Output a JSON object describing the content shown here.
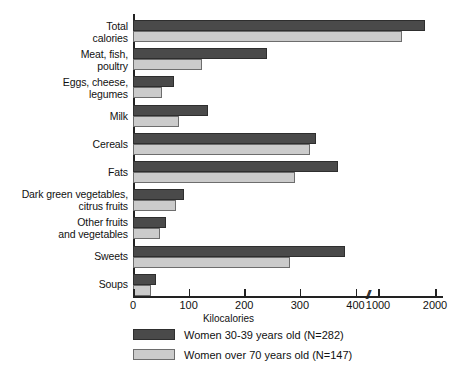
{
  "chart_data": {
    "type": "bar",
    "orientation": "horizontal",
    "title": "",
    "xlabel": "Kilocalories",
    "ylabel": "",
    "categories": [
      "Total\ncalories",
      "Meat, fish,\npoultry",
      "Eggs, cheese,\nlegumes",
      "Milk",
      "Cereals",
      "Fats",
      "Dark green vegetables,\ncitrus fruits",
      "Other fruits\nand vegetables",
      "Sweets",
      "Soups"
    ],
    "series": [
      {
        "name": "Women 30-39 years old (N=282)",
        "color": "#4a4a4a",
        "values": [
          1825,
          241,
          74,
          134,
          329,
          368,
          92,
          59,
          382,
          41
        ]
      },
      {
        "name": "Women over 70 years old (N=147)",
        "color": "#cbcbcb",
        "values": [
          1420,
          124,
          52,
          83,
          319,
          292,
          77,
          49,
          283,
          32
        ]
      }
    ],
    "xticks": [
      {
        "label": "0",
        "value": 0
      },
      {
        "label": "100",
        "value": 100
      },
      {
        "label": "200",
        "value": 200
      },
      {
        "label": "300",
        "value": 300
      },
      {
        "label": "400",
        "value": 400
      },
      {
        "label": "1000",
        "value": 1000
      },
      {
        "label": "2000",
        "value": 2000
      }
    ],
    "axis_break": {
      "symbol": "//",
      "between": [
        400,
        1000
      ]
    },
    "xlim": [
      0,
      2000
    ],
    "grid": false,
    "legend_position": "bottom-left"
  },
  "legend": {
    "entries": [
      {
        "label": "Women 30-39 years old (N=282)",
        "swatch": "dark"
      },
      {
        "label": "Women over 70 years old (N=147)",
        "swatch": "light"
      }
    ]
  },
  "axis": {
    "x_title": "Kilocalories",
    "break_symbol": "//"
  }
}
